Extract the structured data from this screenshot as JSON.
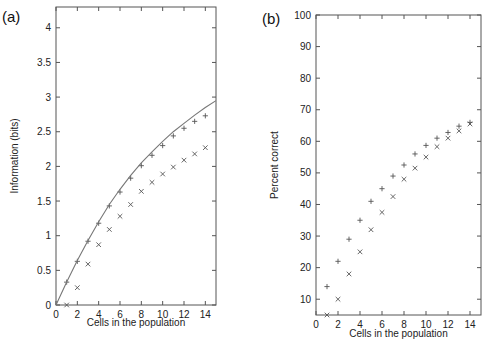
{
  "chart_data": [
    {
      "panel": "(a)",
      "type": "scatter",
      "xlabel": "Cells in the population",
      "ylabel": "Information (bits)",
      "xlim": [
        0,
        15
      ],
      "ylim": [
        0,
        4.3
      ],
      "xticks": [
        0,
        2,
        4,
        6,
        8,
        10,
        12,
        14
      ],
      "yticks": [
        0,
        0.5,
        1,
        1.5,
        2,
        2.5,
        3,
        3.5,
        4
      ],
      "ytick_labels": [
        "0",
        "0.5",
        "1",
        "1.5",
        "2",
        "2.5",
        "3",
        "3.5",
        "4"
      ],
      "grid": false,
      "legend": null,
      "series": [
        {
          "name": "plus",
          "marker": "+",
          "x": [
            1,
            2,
            3,
            4,
            5,
            6,
            7,
            8,
            9,
            10,
            11,
            12,
            13,
            14
          ],
          "values": [
            0.33,
            0.63,
            0.92,
            1.18,
            1.43,
            1.63,
            1.83,
            2.01,
            2.16,
            2.3,
            2.44,
            2.55,
            2.65,
            2.73
          ]
        },
        {
          "name": "cross",
          "marker": "x",
          "x": [
            1,
            2,
            3,
            4,
            5,
            6,
            7,
            8,
            9,
            10,
            11,
            12,
            13,
            14
          ],
          "values": [
            0.0,
            0.25,
            0.59,
            0.87,
            1.09,
            1.28,
            1.45,
            1.64,
            1.77,
            1.89,
            1.99,
            2.09,
            2.18,
            2.27
          ]
        },
        {
          "name": "fit-curve",
          "marker": "line",
          "x": [
            0,
            1,
            2,
            3,
            4,
            5,
            6,
            7,
            8,
            9,
            10,
            11,
            12,
            13,
            14,
            15
          ],
          "values": [
            0,
            0.33,
            0.64,
            0.93,
            1.2,
            1.45,
            1.67,
            1.87,
            2.05,
            2.21,
            2.36,
            2.5,
            2.62,
            2.74,
            2.85,
            2.95
          ]
        }
      ]
    },
    {
      "panel": "(b)",
      "type": "scatter",
      "xlabel": "Cells in the population",
      "ylabel": "Percent correct",
      "xlim": [
        0,
        15
      ],
      "ylim": [
        5,
        100
      ],
      "xticks": [
        0,
        2,
        4,
        6,
        8,
        10,
        12,
        14
      ],
      "yticks": [
        10,
        20,
        30,
        40,
        50,
        60,
        70,
        80,
        90,
        100
      ],
      "grid": false,
      "legend": null,
      "series": [
        {
          "name": "plus",
          "marker": "+",
          "x": [
            1,
            2,
            3,
            4,
            5,
            6,
            7,
            8,
            9,
            10,
            11,
            12,
            13,
            14
          ],
          "values": [
            14,
            22,
            29,
            35,
            41,
            45,
            49,
            52.5,
            56,
            58.7,
            61,
            62.8,
            64.8,
            66
          ]
        },
        {
          "name": "cross",
          "marker": "x",
          "x": [
            1,
            2,
            3,
            4,
            5,
            6,
            7,
            8,
            9,
            10,
            11,
            12,
            13,
            14
          ],
          "values": [
            5,
            10,
            18,
            25,
            32,
            37.5,
            42.5,
            48,
            51.5,
            55,
            58.3,
            61,
            63.3,
            65.5
          ]
        }
      ]
    }
  ]
}
